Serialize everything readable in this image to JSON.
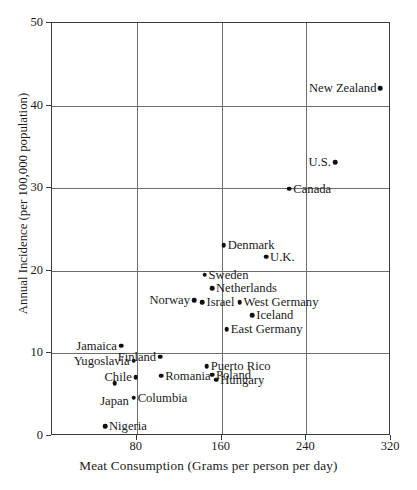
{
  "chart_data": {
    "type": "scatter",
    "title": "",
    "xlabel": "Meat Consumption (Grams per person per day)",
    "ylabel": "Annual Incidence (per 100,000 population)",
    "xlim": [
      0,
      320
    ],
    "ylim": [
      0,
      50
    ],
    "xticks": [
      80,
      160,
      240,
      320
    ],
    "yticks": [
      0,
      10,
      20,
      30,
      40,
      50
    ],
    "grid": true,
    "legend": "none",
    "points": [
      {
        "label": "New Zealand",
        "x": 311,
        "y": 42.0,
        "side": "left"
      },
      {
        "label": "U.S.",
        "x": 268,
        "y": 33.0,
        "side": "left"
      },
      {
        "label": "Canada",
        "x": 225,
        "y": 29.8,
        "side": "right"
      },
      {
        "label": "Denmark",
        "x": 163,
        "y": 23.0,
        "side": "right"
      },
      {
        "label": "U.K.",
        "x": 203,
        "y": 21.6,
        "side": "right"
      },
      {
        "label": "Sweden",
        "x": 145,
        "y": 19.4,
        "side": "right"
      },
      {
        "label": "Netherlands",
        "x": 152,
        "y": 17.8,
        "side": "right"
      },
      {
        "label": "Norway",
        "x": 135,
        "y": 16.3,
        "side": "left"
      },
      {
        "label": "Israel",
        "x": 143,
        "y": 16.1,
        "side": "right"
      },
      {
        "label": "West Germany",
        "x": 178,
        "y": 16.1,
        "side": "right"
      },
      {
        "label": "Iceland",
        "x": 190,
        "y": 14.5,
        "side": "right"
      },
      {
        "label": "East Germany",
        "x": 166,
        "y": 12.8,
        "side": "right"
      },
      {
        "label": "Jamaica",
        "x": 66,
        "y": 10.8,
        "side": "left"
      },
      {
        "label": "Yugoslavia",
        "x": 78,
        "y": 9.0,
        "side": "left"
      },
      {
        "label": "Finland",
        "x": 103,
        "y": 9.5,
        "side": "left"
      },
      {
        "label": "Puerto Rico",
        "x": 147,
        "y": 8.3,
        "side": "right"
      },
      {
        "label": "Poland",
        "x": 152,
        "y": 7.3,
        "side": "right"
      },
      {
        "label": "Chile",
        "x": 80,
        "y": 7.0,
        "side": "left"
      },
      {
        "label": "Romania",
        "x": 104,
        "y": 7.2,
        "side": "right"
      },
      {
        "label": "Hungary",
        "x": 156,
        "y": 6.7,
        "side": "right"
      },
      {
        "label": "Japan",
        "x": 60,
        "y": 6.3,
        "side": "below"
      },
      {
        "label": "Columbia",
        "x": 78,
        "y": 4.5,
        "side": "right"
      },
      {
        "label": "Nigeria",
        "x": 51,
        "y": 1.1,
        "side": "right"
      }
    ]
  }
}
